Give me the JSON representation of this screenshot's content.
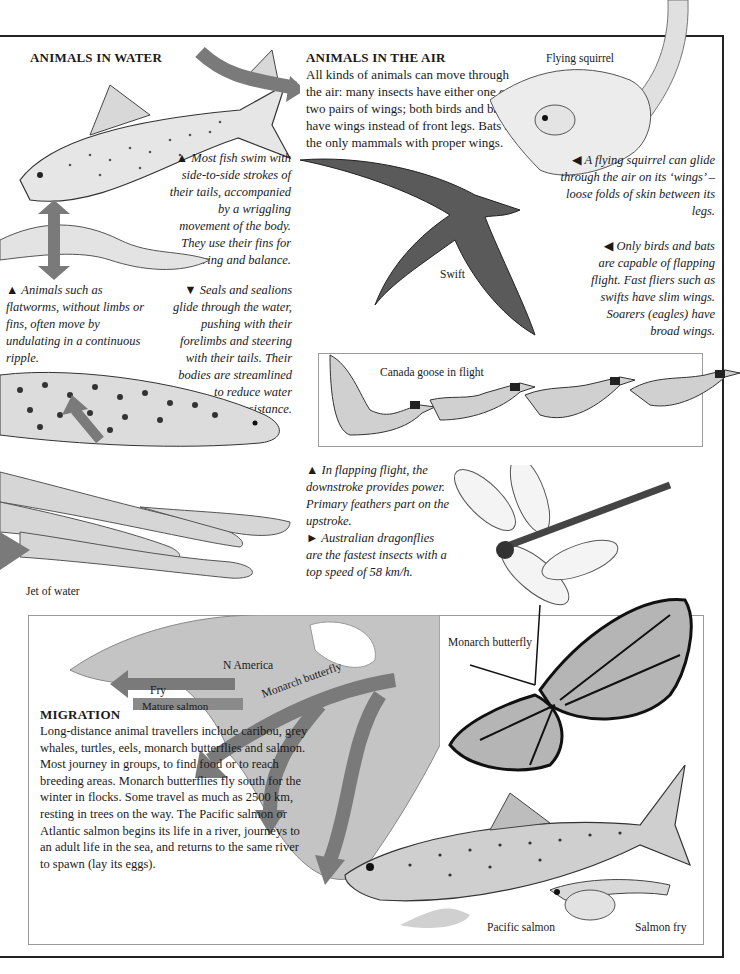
{
  "water": {
    "heading": "ANIMALS IN WATER",
    "fish_caption": "▲ Most fish swim with side-to-side strokes of their tails, accompanied by a wriggling movement of the body. They use their fins for steering and balance.",
    "flatworm_caption": "▲ Animals such as flatworms, without limbs or fins, often move by undulating in a continuous ripple.",
    "seal_caption": "▼ Seals and sealions glide through the water, pushing with their forelimbs and steering with their tails. Their bodies are streamlined to reduce water resistance.",
    "jet_label": "Jet of water"
  },
  "air": {
    "heading": "ANIMALS IN THE AIR",
    "intro": "All kinds of animals can move through the air: many insects have either one or two pairs of wings; both birds and bats have wings instead of front legs. Bats are the only mammals with proper wings.",
    "squirrel_label": "Flying squirrel",
    "squirrel_caption": "◀ A flying squirrel can glide through the air on its ‘wings’ – loose folds of skin between its legs.",
    "flight_caption": "◀ Only birds and bats are capable of flapping flight. Fast fliers such as swifts have slim wings. Soarers (eagles) have broad wings.",
    "swift_label": "Swift",
    "goose_label": "Canada goose in flight",
    "flapping_caption": "▲ In flapping flight, the downstroke provides power. Primary feathers part on the upstroke.",
    "dragonfly_caption": "► Australian dragonflies are the fastest insects with a top speed of 58 km/h."
  },
  "migration": {
    "heading": "MIGRATION",
    "body": "Long-distance animal travellers include caribou, grey whales, turtles, eels, monarch butterflies and salmon. Most journey in groups, to find food or to reach breeding areas. Monarch butterflies fly south for the winter in flocks. Some travel as much as 2500 km, resting in trees on the way. The Pacific salmon or Atlantic salmon begins its life in a river, journeys to an adult life in the sea, and returns to the same river to spawn (lay its eggs).",
    "map_labels": {
      "continent": "N America",
      "fry_arrow": "Fry",
      "mature_arrow": "Mature salmon",
      "monarch_arrow": "Monarch butterfly"
    },
    "monarch_label": "Monarch butterfly",
    "pacific_label": "Pacific salmon",
    "fry_label": "Salmon fry"
  },
  "colors": {
    "arrow": "#7a7a7a",
    "map": "#bdbdbd",
    "rule": "#222222"
  }
}
